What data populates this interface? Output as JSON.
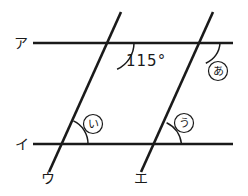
{
  "figure": {
    "stroke_color": "#1a1a1a",
    "background_color": "#ffffff",
    "parallel_lines": [
      {
        "name": "a",
        "label": "ア",
        "y": 43,
        "x_start": 33,
        "x_end": 233
      },
      {
        "name": "i",
        "label": "イ",
        "y": 144,
        "x_start": 33,
        "x_end": 233
      }
    ],
    "transversals": [
      {
        "name": "u",
        "label": "ウ",
        "x1": 121,
        "y1": 12,
        "x2": 49,
        "y2": 172
      },
      {
        "name": "e",
        "label": "エ",
        "x1": 213,
        "y1": 12,
        "x2": 141,
        "y2": 172
      }
    ],
    "angles": [
      {
        "name": "given-angle",
        "text": "115°",
        "x": 126,
        "y": 54
      },
      {
        "name": "angle-a",
        "text": "あ",
        "x": 210,
        "y": 62
      },
      {
        "name": "angle-i",
        "text": "い",
        "x": 85,
        "y": 115
      },
      {
        "name": "angle-u",
        "text": "う",
        "x": 176,
        "y": 114
      }
    ],
    "line_labels": [
      {
        "name": "label-a",
        "text": "ア",
        "x": 14,
        "y": 36
      },
      {
        "name": "label-i",
        "text": "イ",
        "x": 15,
        "y": 137
      },
      {
        "name": "label-u",
        "text": "ウ",
        "x": 41,
        "y": 171
      },
      {
        "name": "label-e",
        "text": "エ",
        "x": 134,
        "y": 171
      }
    ]
  }
}
